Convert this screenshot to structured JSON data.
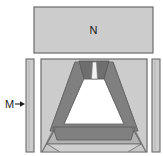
{
  "figure": {
    "type": "schematic-cross-section",
    "background": "#ffffff",
    "labels": {
      "top_part": "N",
      "side_part": "M"
    },
    "colors": {
      "light_gray": "#cccccc",
      "mid_gray": "#b3b3b3",
      "dark_gray": "#808080",
      "darker_gray": "#6e6e6e",
      "white": "#ffffff",
      "outline": "#6b6b6b",
      "text": "#1a1a1a"
    },
    "parts": {
      "top_block": {
        "name": "N",
        "shape": "rectangle",
        "fill": "#cccccc",
        "stroke": "#6b6b6b"
      },
      "left_bar": {
        "name": "M",
        "shape": "vertical-bar",
        "fill": "#cccccc",
        "stroke": "#6b6b6b"
      },
      "right_bar": {
        "shape": "vertical-bar",
        "fill": "#cccccc",
        "stroke": "#6b6b6b"
      },
      "main_box": {
        "shape": "square-frame",
        "fill": "#cccccc",
        "stroke": "#6b6b6b"
      },
      "cone_wall_left": {
        "fill": "#808080"
      },
      "cone_wall_right": {
        "fill": "#808080"
      },
      "cone_cavity": {
        "fill": "#ffffff"
      },
      "top_neck": {
        "fill": "#6e6e6e"
      },
      "neck_slot": {
        "fill": "#ffffff"
      },
      "bottom_band_upper": {
        "fill": "#808080"
      },
      "bottom_band_lower": {
        "fill": "#b3b3b3"
      },
      "bottom_skirt": {
        "fill": "#cccccc"
      }
    },
    "annotations": {
      "arrow_M": {
        "label": "M",
        "direction": "right",
        "points_to": "left_bar"
      }
    }
  }
}
